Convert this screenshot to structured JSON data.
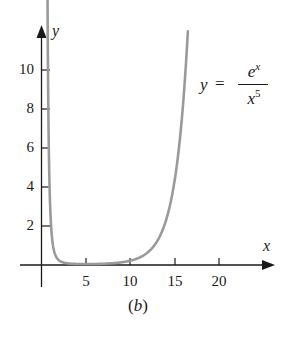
{
  "chart_data": {
    "type": "line",
    "title": "",
    "function": "y = e^x / x^5",
    "equation_label": {
      "lhs": "y",
      "eq": "=",
      "numerator_base": "e",
      "numerator_exp": "x",
      "denominator_base": "x",
      "denominator_exp": "5"
    },
    "xlabel": "x",
    "ylabel": "y",
    "caption": "(b)",
    "x_ticks": [
      5,
      10,
      15,
      20
    ],
    "y_ticks": [
      2,
      4,
      6,
      8,
      10
    ],
    "xlim": [
      0,
      26
    ],
    "ylim": [
      0,
      12
    ],
    "grid": false,
    "legend": "none",
    "series": [
      {
        "name": "y = e^x / x^5",
        "color": "#9a9a9a",
        "x": [
          0.63,
          0.7,
          0.8,
          1.0,
          1.5,
          2.0,
          3.0,
          5.0,
          7.0,
          9.0,
          10.0,
          11.0,
          12.0,
          13.0,
          14.0,
          15.0,
          16.0,
          16.5
        ],
        "values": [
          11.5,
          7.5,
          3.8,
          2.72,
          0.59,
          0.23,
          0.083,
          0.047,
          0.065,
          0.137,
          0.22,
          0.37,
          0.65,
          1.19,
          2.23,
          4.3,
          8.45,
          11.9
        ]
      }
    ]
  },
  "axes": {
    "x_label": "x",
    "y_label": "y",
    "x_tick_labels": [
      "5",
      "10",
      "15",
      "20"
    ],
    "y_tick_labels": [
      "10",
      "8",
      "6",
      "4",
      "2"
    ]
  },
  "equation": {
    "lhs": "y",
    "eq": "=",
    "num": "e",
    "num_sup": "x",
    "den": "x",
    "den_sup": "5"
  },
  "caption": {
    "open": "(",
    "letter": "b",
    "close": ")"
  },
  "colors": {
    "axis": "#1a1a1a",
    "curve": "#9a9a9a",
    "background": "#ffffff"
  }
}
